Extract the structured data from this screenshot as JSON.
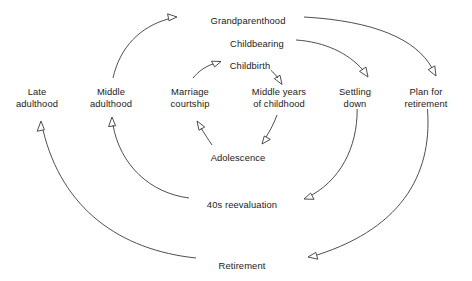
{
  "diagram": {
    "background_color": "#ffffff",
    "line_color": "#3a3a3a",
    "text_color": "#1b1b1b",
    "nodes": [
      {
        "id": "late_adulthood",
        "label_lines": [
          "Late",
          "adulthood"
        ],
        "x": 37,
        "y": 86
      },
      {
        "id": "middle_adulthood",
        "label_lines": [
          "Middle",
          "adulthood"
        ],
        "x": 111,
        "y": 86
      },
      {
        "id": "marriage_courtship",
        "label_lines": [
          "Marriage",
          "courtship"
        ],
        "x": 190,
        "y": 86
      },
      {
        "id": "middle_years",
        "label_lines": [
          "Middle years",
          "of childhood"
        ],
        "x": 279,
        "y": 86
      },
      {
        "id": "settling_down",
        "label_lines": [
          "Settling",
          "down"
        ],
        "x": 355,
        "y": 86
      },
      {
        "id": "plan_retirement",
        "label_lines": [
          "Plan for",
          "retirement"
        ],
        "x": 426,
        "y": 86
      },
      {
        "id": "grandparenthood",
        "label_lines": [
          "Grandparenthood"
        ],
        "x": 248,
        "y": 15
      },
      {
        "id": "childbearing",
        "label_lines": [
          "Childbearing"
        ],
        "x": 257,
        "y": 38
      },
      {
        "id": "childbirth",
        "label_lines": [
          "Childbirth"
        ],
        "x": 250,
        "y": 60
      },
      {
        "id": "adolescence",
        "label_lines": [
          "Adolescence"
        ],
        "x": 238,
        "y": 152
      },
      {
        "id": "forties_reeval",
        "label_lines": [
          "40s reevaluation"
        ],
        "x": 242,
        "y": 199
      },
      {
        "id": "retirement",
        "label_lines": [
          "Retirement"
        ],
        "x": 242,
        "y": 260
      }
    ],
    "edges": [
      {
        "id": "marriage-to-childbirth",
        "from": "marriage_courtship",
        "to": "childbirth",
        "arrow": true
      },
      {
        "id": "childbirth-to-middle-years",
        "from": "childbirth",
        "to": "middle_years",
        "arrow": true
      },
      {
        "id": "middle-years-to-adolescence",
        "from": "middle_years",
        "to": "adolescence",
        "arrow": true
      },
      {
        "id": "adolescence-to-marriage",
        "from": "adolescence",
        "to": "marriage_courtship",
        "arrow": true
      },
      {
        "id": "childbearing-to-settling-down",
        "from": "childbearing",
        "to": "settling_down",
        "arrow": true
      },
      {
        "id": "settling-down-to-40s",
        "from": "settling_down",
        "to": "forties_reeval",
        "arrow": true
      },
      {
        "id": "40s-to-middle-adulthood",
        "from": "forties_reeval",
        "to": "middle_adulthood",
        "arrow": true
      },
      {
        "id": "middle-adulthood-to-grandparenthood",
        "from": "middle_adulthood",
        "to": "grandparenthood",
        "arrow": true
      },
      {
        "id": "grandparenthood-to-plan",
        "from": "grandparenthood",
        "to": "plan_retirement",
        "arrow": true
      },
      {
        "id": "plan-to-retirement",
        "from": "plan_retirement",
        "to": "retirement",
        "arrow": true
      },
      {
        "id": "retirement-to-late-adulthood",
        "from": "retirement",
        "to": "late_adulthood",
        "arrow": true
      }
    ]
  }
}
